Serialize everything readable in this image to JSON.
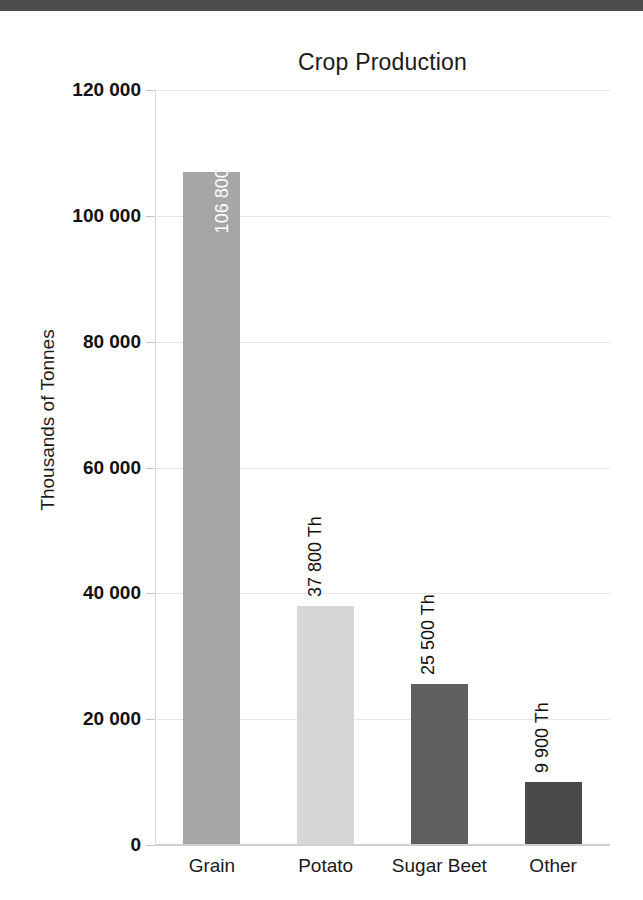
{
  "banner": {
    "color": "#4d4d4d"
  },
  "chart_data": {
    "type": "bar",
    "title": "Crop Production",
    "xlabel": "",
    "ylabel": "Thousands of Tonnes",
    "categories": [
      "Grain",
      "Potato",
      "Sugar Beet",
      "Other"
    ],
    "values": [
      106800,
      37800,
      25500,
      9900
    ],
    "data_labels": [
      "106 800 Th",
      "37 800 Th",
      "25 500 Th",
      "9 900 Th"
    ],
    "label_placement": [
      "inside",
      "outside",
      "outside",
      "outside"
    ],
    "bar_colors": [
      "#a6a6a6",
      "#d6d6d6",
      "#5f5f5f",
      "#4a4a4a"
    ],
    "ylim": [
      0,
      120000
    ],
    "ytick_values": [
      0,
      20000,
      40000,
      60000,
      80000,
      100000,
      120000
    ],
    "ytick_labels": [
      "0",
      "20 000",
      "40 000",
      "60 000",
      "80 000",
      "100 000",
      "120 000"
    ],
    "grid": true,
    "legend": false,
    "gridline_color": "#e6e6e6",
    "axis_color": "#cfcfcf"
  }
}
